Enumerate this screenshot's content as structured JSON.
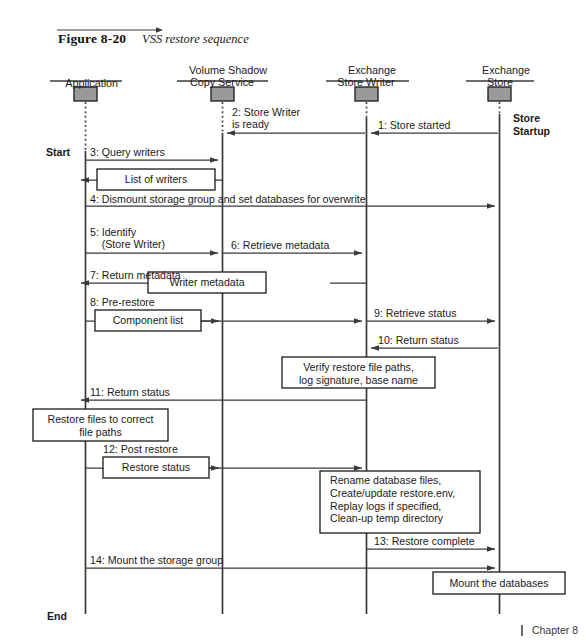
{
  "figure": {
    "label": "Figure 8-20",
    "title": "VSS restore sequence"
  },
  "footer": {
    "separator": "|",
    "text": "Chapter 8"
  },
  "colors": {
    "line": "#3a3a3a",
    "text": "#1a1a1a",
    "object_box_fill": "#9a9a9a",
    "object_box_stroke": "#1a1a1a",
    "note_fill": "#ffffff",
    "note_stroke": "#1a1a1a"
  },
  "lifelines": [
    {
      "id": "application",
      "label": "Application",
      "x": 85
    },
    {
      "id": "vss",
      "label": "Volume Shadow\nCopy Service",
      "x": 222
    },
    {
      "id": "store-writer",
      "label": "Exchange\nStore Writer",
      "x": 366
    },
    {
      "id": "exchange-store",
      "label": "Exchange\nStore",
      "x": 499
    }
  ],
  "annotations": [
    {
      "id": "store-startup",
      "text": "Store\nStartup",
      "bold": true
    },
    {
      "id": "start",
      "text": "Start",
      "bold": true
    },
    {
      "id": "end",
      "text": "End",
      "bold": true
    }
  ],
  "messages": [
    {
      "num": "1",
      "label": "1: Store started",
      "from": "exchange-store",
      "to": "store-writer",
      "dir": "left"
    },
    {
      "num": "2",
      "label": "2: Store Writer\nis ready",
      "from": "store-writer",
      "to": "vss",
      "dir": "left"
    },
    {
      "num": "3",
      "label": "3: Query writers",
      "from": "application",
      "to": "vss",
      "dir": "right"
    },
    {
      "num": "4",
      "label": "4: Dismount storage group and set databases for overwrite",
      "from": "application",
      "to": "exchange-store",
      "dir": "right"
    },
    {
      "num": "5",
      "label": "5: Identify\n    (Store Writer)",
      "from": "application",
      "to": "vss",
      "dir": "right"
    },
    {
      "num": "6",
      "label": "6: Retrieve metadata",
      "from": "vss",
      "to": "store-writer",
      "dir": "right"
    },
    {
      "num": "7",
      "label": "7: Return metadata",
      "from": "vss",
      "to": "application",
      "dir": "left"
    },
    {
      "num": "8",
      "label": "8: Pre-restore",
      "from": "application",
      "to": "store-writer",
      "dir": "right"
    },
    {
      "num": "9",
      "label": "9: Retrieve status",
      "from": "store-writer",
      "to": "exchange-store",
      "dir": "right"
    },
    {
      "num": "10",
      "label": "10: Return status",
      "from": "exchange-store",
      "to": "store-writer",
      "dir": "left"
    },
    {
      "num": "11",
      "label": "11: Return status",
      "from": "store-writer",
      "to": "application",
      "dir": "left"
    },
    {
      "num": "12",
      "label": "12: Post restore",
      "from": "application",
      "to": "store-writer",
      "dir": "right"
    },
    {
      "num": "13",
      "label": "13: Restore complete",
      "from": "store-writer",
      "to": "exchange-store",
      "dir": "right"
    },
    {
      "num": "14",
      "label": "14: Mount the storage group",
      "from": "application",
      "to": "exchange-store",
      "dir": "right"
    }
  ],
  "notes": [
    {
      "id": "list-of-writers",
      "text": "List of writers",
      "align": "center"
    },
    {
      "id": "writer-metadata",
      "text": "Writer metadata",
      "align": "center"
    },
    {
      "id": "component-list",
      "text": "Component list",
      "align": "center"
    },
    {
      "id": "verify-restore",
      "text": "Verify restore file paths,\nlog signature, base name",
      "align": "center"
    },
    {
      "id": "restore-files",
      "text": "Restore files to correct\nfile paths",
      "align": "center"
    },
    {
      "id": "restore-status",
      "text": "Restore status",
      "align": "center"
    },
    {
      "id": "rename-database",
      "text": "Rename database files,\nCreate/update restore.env,\nReplay logs if specified,\nClean-up temp directory",
      "align": "left"
    },
    {
      "id": "mount-databases",
      "text": "Mount the databases",
      "align": "center"
    }
  ]
}
